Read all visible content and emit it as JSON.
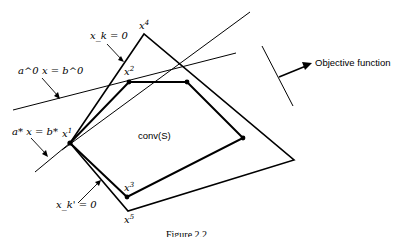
{
  "figure": {
    "caption": "Figure 2.2",
    "region_label": "conv(S)",
    "objective_label": "Objective function",
    "constraints": {
      "xk": "x_k = 0",
      "xk_prime": "x_k' = 0",
      "a0": "a^0 x = b^0",
      "astar": "a* x = b*"
    },
    "vertices": [
      {
        "id": "x1",
        "base": "x",
        "sup": "1",
        "x": 70,
        "y": 143
      },
      {
        "id": "x2",
        "base": "x",
        "sup": "2",
        "x": 129,
        "y": 82
      },
      {
        "id": "x3",
        "base": "x",
        "sup": "3",
        "x": 127,
        "y": 197
      },
      {
        "id": "x4",
        "base": "x",
        "sup": "4",
        "x": 144,
        "y": 34
      },
      {
        "id": "x5",
        "base": "x",
        "sup": "5",
        "x": 128,
        "y": 211
      }
    ],
    "colors": {
      "ink": "#000000",
      "background": "#ffffff"
    }
  }
}
